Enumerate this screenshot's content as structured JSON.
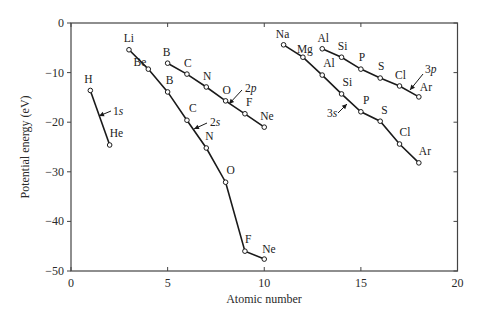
{
  "chart_data": {
    "type": "line",
    "title": "",
    "xlabel": "Atomic number",
    "ylabel": "Potential energy (eV)",
    "xlim": [
      0,
      20
    ],
    "ylim": [
      -50,
      0
    ],
    "xticks": [
      0,
      5,
      10,
      15,
      20
    ],
    "yticks": [
      0,
      -10,
      -20,
      -30,
      -40,
      -50
    ],
    "grid": false,
    "legend": "none (series labeled inline with arrows)",
    "series": [
      {
        "name": "1s",
        "points": [
          {
            "element": "H",
            "x": 1,
            "y": -13.6
          },
          {
            "element": "He",
            "x": 2,
            "y": -24.6
          }
        ]
      },
      {
        "name": "2s",
        "points": [
          {
            "element": "Li",
            "x": 3,
            "y": -5.4
          },
          {
            "element": "Be",
            "x": 4,
            "y": -9.3
          },
          {
            "element": "B",
            "x": 5,
            "y": -13.9
          },
          {
            "element": "C",
            "x": 6,
            "y": -19.6
          },
          {
            "element": "N",
            "x": 7,
            "y": -25.2
          },
          {
            "element": "O",
            "x": 8,
            "y": -32.1
          },
          {
            "element": "F",
            "x": 9,
            "y": -46.0
          },
          {
            "element": "Ne",
            "x": 10,
            "y": -47.6
          }
        ]
      },
      {
        "name": "2p",
        "points": [
          {
            "element": "B",
            "x": 5,
            "y": -8.1
          },
          {
            "element": "C",
            "x": 6,
            "y": -10.3
          },
          {
            "element": "N",
            "x": 7,
            "y": -12.9
          },
          {
            "element": "O",
            "x": 8,
            "y": -15.7
          },
          {
            "element": "F",
            "x": 9,
            "y": -18.3
          },
          {
            "element": "Ne",
            "x": 10,
            "y": -21.0
          }
        ]
      },
      {
        "name": "3s",
        "points": [
          {
            "element": "Na",
            "x": 11,
            "y": -4.4
          },
          {
            "element": "Mg",
            "x": 12,
            "y": -6.9
          },
          {
            "element": "Al",
            "x": 13,
            "y": -10.5
          },
          {
            "element": "Si",
            "x": 14,
            "y": -14.3
          },
          {
            "element": "P",
            "x": 15,
            "y": -17.9
          },
          {
            "element": "S",
            "x": 16,
            "y": -19.8
          },
          {
            "element": "Cl",
            "x": 17,
            "y": -24.4
          },
          {
            "element": "Ar",
            "x": 18,
            "y": -28.2
          }
        ]
      },
      {
        "name": "3p",
        "points": [
          {
            "element": "Al",
            "x": 13,
            "y": -5.2
          },
          {
            "element": "Si",
            "x": 14,
            "y": -6.9
          },
          {
            "element": "P",
            "x": 15,
            "y": -9.3
          },
          {
            "element": "S",
            "x": 16,
            "y": -11.1
          },
          {
            "element": "Cl",
            "x": 17,
            "y": -12.7
          },
          {
            "element": "Ar",
            "x": 18,
            "y": -14.9
          }
        ]
      }
    ],
    "annotations": [
      {
        "text": "1s",
        "series": "1s"
      },
      {
        "text": "2s",
        "series": "2s"
      },
      {
        "text": "2p",
        "series": "2p"
      },
      {
        "text": "3s",
        "series": "3s"
      },
      {
        "text": "3p",
        "series": "3p"
      }
    ]
  },
  "labels": {
    "xlabel": "Atomic number",
    "ylabel": "Potential energy (eV)",
    "xticks": [
      "0",
      "5",
      "10",
      "15",
      "20"
    ],
    "yticks": [
      "0",
      "−10",
      "−20",
      "−30",
      "−40",
      "−50"
    ]
  },
  "style": {
    "line_color": "#1a1a1a",
    "marker_fill": "#ffffff",
    "frame_color": "#444444"
  }
}
